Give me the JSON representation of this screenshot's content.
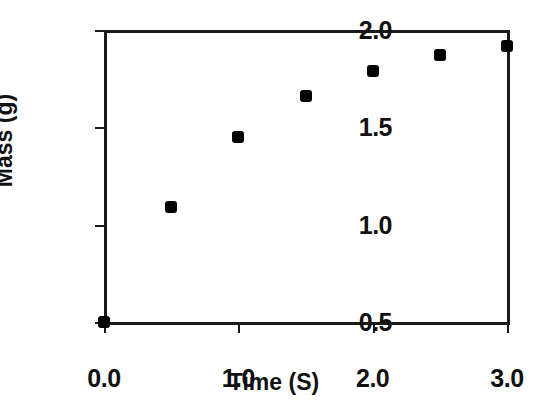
{
  "chart_data": {
    "type": "scatter",
    "title": "",
    "xlabel": "Time (S)",
    "ylabel": "Mass (g)",
    "xlim": [
      0.0,
      3.0
    ],
    "ylim": [
      0.5,
      2.0
    ],
    "grid": false,
    "legend": null,
    "marker": {
      "shape": "filled-square",
      "color": "#000000",
      "size_px": 12
    },
    "axis_color": "#1a1a1a",
    "background": "#ffffff",
    "xticks": [
      {
        "value": 0.0,
        "label": "0.0"
      },
      {
        "value": 1.0,
        "label": "1.0"
      },
      {
        "value": 2.0,
        "label": "2.0"
      },
      {
        "value": 3.0,
        "label": "3.0"
      }
    ],
    "yticks": [
      {
        "value": 0.5,
        "label": "0.5"
      },
      {
        "value": 1.0,
        "label": "1.0"
      },
      {
        "value": 1.5,
        "label": "1.5"
      },
      {
        "value": 2.0,
        "label": "2.0"
      }
    ],
    "x": [
      0.0,
      0.5,
      1.0,
      1.5,
      2.0,
      2.5,
      3.0
    ],
    "values": [
      0.5,
      1.09,
      1.45,
      1.66,
      1.79,
      1.87,
      1.92
    ],
    "points": [
      {
        "x": 0.0,
        "y": 0.5
      },
      {
        "x": 0.5,
        "y": 1.09
      },
      {
        "x": 1.0,
        "y": 1.45
      },
      {
        "x": 1.5,
        "y": 1.66
      },
      {
        "x": 2.0,
        "y": 1.79
      },
      {
        "x": 2.5,
        "y": 1.87
      },
      {
        "x": 3.0,
        "y": 1.92
      }
    ]
  }
}
